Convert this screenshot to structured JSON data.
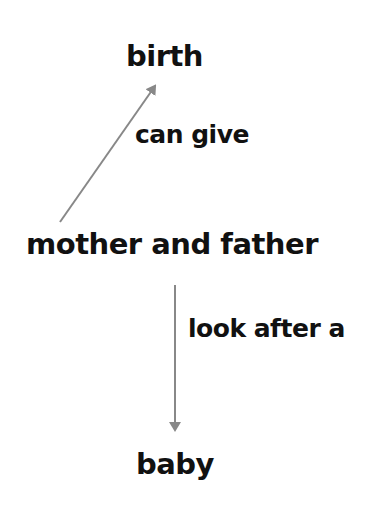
{
  "diagram": {
    "type": "concept-map",
    "nodes": {
      "birth": {
        "label": "birth"
      },
      "parents": {
        "label": "mother and father"
      },
      "baby": {
        "label": "baby"
      }
    },
    "edges": [
      {
        "from": "mother and father",
        "to": "birth",
        "label": "can give"
      },
      {
        "from": "mother and father",
        "to": "baby",
        "label": "look after a"
      }
    ],
    "colors": {
      "text": "#111111",
      "arrow": "#888888",
      "background": "#ffffff"
    }
  }
}
